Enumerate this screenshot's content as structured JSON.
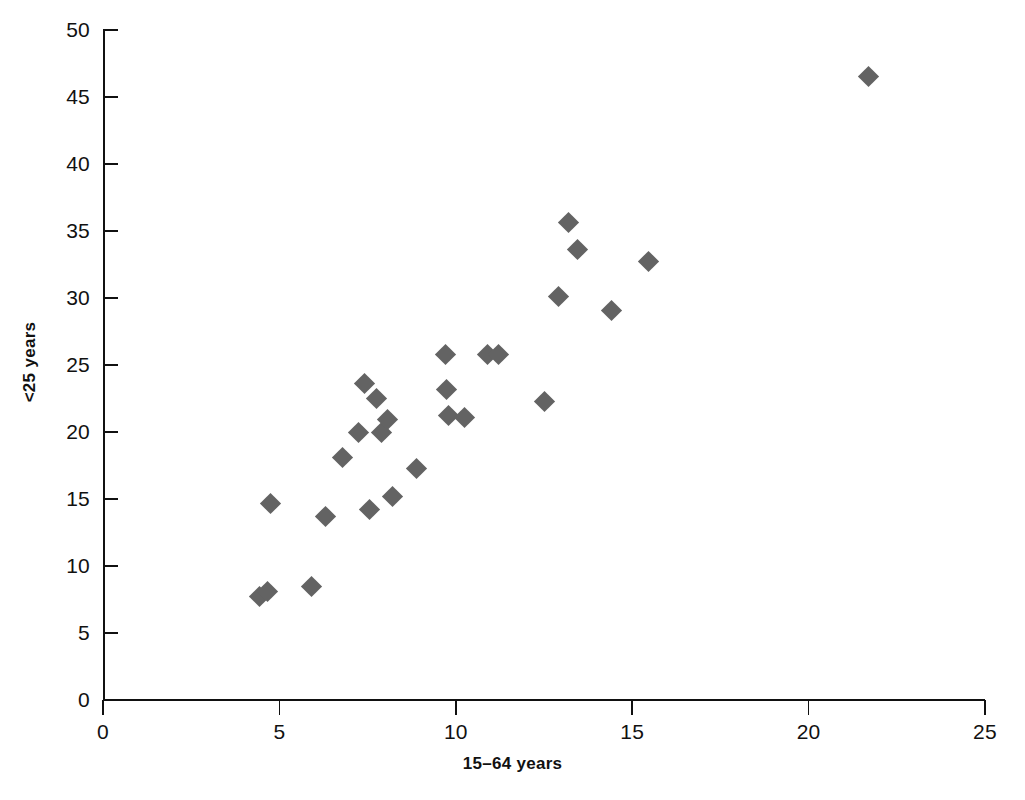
{
  "chart_data": {
    "type": "scatter",
    "title": "",
    "xlabel": "15–64 years",
    "ylabel": "<25 years",
    "xlim": [
      0,
      25
    ],
    "ylim": [
      0,
      50
    ],
    "xticks": [
      0,
      5,
      10,
      15,
      20,
      25
    ],
    "yticks": [
      0,
      5,
      10,
      15,
      20,
      25,
      30,
      35,
      40,
      45,
      50
    ],
    "xtick_labels": [
      "0",
      "5",
      "10",
      "15",
      "20",
      "25"
    ],
    "ytick_labels": [
      "0",
      "5",
      "10",
      "15",
      "20",
      "25",
      "30",
      "35",
      "40",
      "45",
      "50"
    ],
    "grid": false,
    "legend": false,
    "marker_shape": "diamond",
    "marker_color": "#636363",
    "axis_color": "#111111",
    "background": "#ffffff",
    "series": [
      {
        "name": "countries",
        "points": [
          [
            4.45,
            7.7
          ],
          [
            4.65,
            8.1
          ],
          [
            4.75,
            14.7
          ],
          [
            5.9,
            8.5
          ],
          [
            6.3,
            13.7
          ],
          [
            6.8,
            18.1
          ],
          [
            7.25,
            20.0
          ],
          [
            7.4,
            23.6
          ],
          [
            7.55,
            14.2
          ],
          [
            7.75,
            22.5
          ],
          [
            7.9,
            20.0
          ],
          [
            8.05,
            20.9
          ],
          [
            8.2,
            15.2
          ],
          [
            8.9,
            17.3
          ],
          [
            9.7,
            25.8
          ],
          [
            9.75,
            23.2
          ],
          [
            9.8,
            21.2
          ],
          [
            10.25,
            21.1
          ],
          [
            10.9,
            25.8
          ],
          [
            11.2,
            25.8
          ],
          [
            12.5,
            22.3
          ],
          [
            12.9,
            30.1
          ],
          [
            13.2,
            35.6
          ],
          [
            13.45,
            33.6
          ],
          [
            14.4,
            29.1
          ],
          [
            15.45,
            32.7
          ],
          [
            21.7,
            46.5
          ]
        ]
      }
    ]
  }
}
